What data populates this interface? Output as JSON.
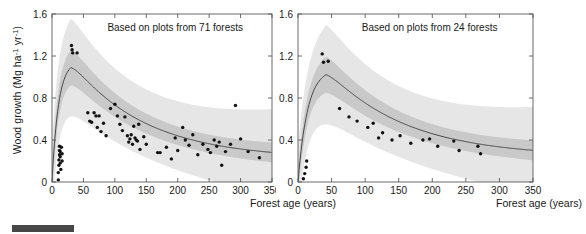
{
  "figure": {
    "ylabel_prefix": "Wood growth (Mg ha",
    "ylabel_mid": " yr",
    "ylabel_sup1": "-1",
    "ylabel_sup2": "-1",
    "ylabel_suffix": ")",
    "xlabel": "Forest age (years)",
    "caption_text": "",
    "colors": {
      "outer_band": "#e6e6e6",
      "inner_band": "#c9c9c9",
      "fit_line": "#3a3a3a",
      "point": "#111111",
      "axis": "#5a5a5a",
      "caption_bar": "#474747"
    }
  },
  "chart_data": [
    {
      "type": "scatter",
      "panel": "left",
      "title": "Based on plots from 71 forests",
      "xlabel": "Forest age (years)",
      "ylabel": "Wood growth (Mg ha-1 yr-1)",
      "xlim": [
        0,
        350
      ],
      "ylim": [
        0,
        1.6
      ],
      "xticks": [
        0,
        50,
        100,
        150,
        200,
        250,
        300,
        350
      ],
      "yticks": [
        0,
        0.4,
        0.8,
        1.2,
        1.6
      ],
      "grid": false,
      "legend": "none",
      "n_forests": 71,
      "points": [
        [
          10,
          0.02
        ],
        [
          10,
          0.09
        ],
        [
          11,
          0.16
        ],
        [
          11,
          0.21
        ],
        [
          12,
          0.26
        ],
        [
          12,
          0.3
        ],
        [
          12,
          0.34
        ],
        [
          13,
          0.18
        ],
        [
          13,
          0.24
        ],
        [
          13,
          0.29
        ],
        [
          14,
          0.12
        ],
        [
          15,
          0.33
        ],
        [
          16,
          0.27
        ],
        [
          16,
          0.2
        ],
        [
          31,
          1.3
        ],
        [
          32,
          1.26
        ],
        [
          33,
          1.23
        ],
        [
          40,
          1.23
        ],
        [
          57,
          0.66
        ],
        [
          60,
          0.58
        ],
        [
          63,
          0.57
        ],
        [
          67,
          0.66
        ],
        [
          70,
          0.63
        ],
        [
          72,
          0.52
        ],
        [
          75,
          0.63
        ],
        [
          78,
          0.48
        ],
        [
          82,
          0.56
        ],
        [
          86,
          0.44
        ],
        [
          93,
          0.7
        ],
        [
          100,
          0.74
        ],
        [
          104,
          0.63
        ],
        [
          108,
          0.55
        ],
        [
          112,
          0.49
        ],
        [
          116,
          0.62
        ],
        [
          120,
          0.44
        ],
        [
          122,
          0.38
        ],
        [
          124,
          0.41
        ],
        [
          126,
          0.45
        ],
        [
          128,
          0.36
        ],
        [
          130,
          0.53
        ],
        [
          132,
          0.42
        ],
        [
          134,
          0.4
        ],
        [
          136,
          0.39
        ],
        [
          138,
          0.55
        ],
        [
          140,
          0.31
        ],
        [
          146,
          0.43
        ],
        [
          150,
          0.36
        ],
        [
          168,
          0.28
        ],
        [
          172,
          0.28
        ],
        [
          182,
          0.33
        ],
        [
          190,
          0.22
        ],
        [
          196,
          0.42
        ],
        [
          200,
          0.3
        ],
        [
          208,
          0.52
        ],
        [
          212,
          0.4
        ],
        [
          218,
          0.35
        ],
        [
          224,
          0.45
        ],
        [
          232,
          0.26
        ],
        [
          240,
          0.36
        ],
        [
          248,
          0.31
        ],
        [
          252,
          0.28
        ],
        [
          258,
          0.4
        ],
        [
          262,
          0.34
        ],
        [
          266,
          0.38
        ],
        [
          270,
          0.16
        ],
        [
          276,
          0.29
        ],
        [
          284,
          0.36
        ],
        [
          292,
          0.73
        ],
        [
          300,
          0.41
        ],
        [
          312,
          0.29
        ],
        [
          330,
          0.23
        ]
      ],
      "fit_curve_note": "unimodal: rises steeply from 0 at age 0 to peak 1.15 near age 30, then decays to ~0.22 at age 350",
      "fit_peak": {
        "x": 30,
        "y": 1.15
      },
      "fit_end": {
        "x": 350,
        "y": 0.22
      },
      "bands": [
        "inner 50% credible interval",
        "outer 95% credible interval"
      ]
    },
    {
      "type": "scatter",
      "panel": "right",
      "title": "Based on plots from 24 forests",
      "xlabel": "Forest age (years)",
      "ylabel": "Wood growth (Mg ha-1 yr-1)",
      "xlim": [
        0,
        350
      ],
      "ylim": [
        0,
        1.6
      ],
      "xticks": [
        0,
        50,
        100,
        150,
        200,
        250,
        300,
        350
      ],
      "yticks": [
        0,
        0.4,
        0.8,
        1.2,
        1.6
      ],
      "grid": false,
      "legend": "none",
      "n_forests": 24,
      "points": [
        [
          8,
          0.03
        ],
        [
          10,
          0.08
        ],
        [
          12,
          0.14
        ],
        [
          13,
          0.2
        ],
        [
          36,
          1.22
        ],
        [
          38,
          1.14
        ],
        [
          45,
          1.15
        ],
        [
          62,
          0.7
        ],
        [
          76,
          0.62
        ],
        [
          88,
          0.58
        ],
        [
          104,
          0.52
        ],
        [
          112,
          0.56
        ],
        [
          120,
          0.42
        ],
        [
          126,
          0.47
        ],
        [
          140,
          0.4
        ],
        [
          152,
          0.44
        ],
        [
          168,
          0.37
        ],
        [
          186,
          0.4
        ],
        [
          196,
          0.41
        ],
        [
          208,
          0.34
        ],
        [
          232,
          0.39
        ],
        [
          240,
          0.3
        ],
        [
          268,
          0.34
        ],
        [
          272,
          0.27
        ]
      ],
      "fit_curve_note": "unimodal: rises from 0 at age 0 to peak 1.08 near age 42, then decays to ~0.24 at age 350",
      "fit_peak": {
        "x": 42,
        "y": 1.08
      },
      "fit_end": {
        "x": 350,
        "y": 0.24
      },
      "bands": [
        "inner 50% credible interval",
        "outer 95% credible interval"
      ]
    }
  ]
}
